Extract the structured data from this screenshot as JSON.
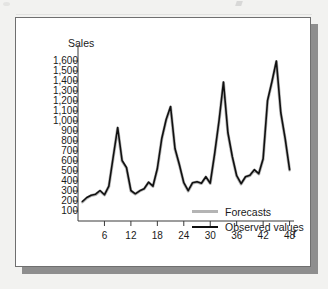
{
  "figure": {
    "background_color": "#f2f2f0",
    "card_color": "#ffffff",
    "shadow_color": "#8e8e8e"
  },
  "chart_data": {
    "type": "line",
    "title": "",
    "ylabel": "Sales",
    "xlabel": "t",
    "ylim": [
      0,
      1700
    ],
    "xlim": [
      0,
      49
    ],
    "grid": false,
    "legend_position": "inside-lower-right",
    "y_ticks": [
      100,
      200,
      300,
      400,
      500,
      600,
      700,
      800,
      900,
      1000,
      1100,
      1200,
      1300,
      1400,
      1500,
      1600
    ],
    "y_tick_labels": [
      "100",
      "200",
      "300",
      "400",
      "500",
      "600",
      "700",
      "800",
      "900",
      "1,000",
      "1,100",
      "1,200",
      "1,300",
      "1,400",
      "1,500",
      "1,600"
    ],
    "x_ticks": [
      6,
      12,
      18,
      24,
      30,
      36,
      42,
      48
    ],
    "x_tick_labels": [
      "6",
      "12",
      "18",
      "24",
      "30",
      "36",
      "42",
      "48"
    ],
    "x": [
      1,
      2,
      3,
      4,
      5,
      6,
      7,
      8,
      9,
      10,
      11,
      12,
      13,
      14,
      15,
      16,
      17,
      18,
      19,
      20,
      21,
      22,
      23,
      24,
      25,
      26,
      27,
      28,
      29,
      30,
      31,
      32,
      33,
      34,
      35,
      36,
      37,
      38,
      39,
      40,
      41,
      42,
      43,
      44,
      45,
      46,
      47,
      48
    ],
    "series": [
      {
        "name": "Forecasts",
        "color": "#b4b4b4",
        "width": 3,
        "values": [
          190,
          230,
          255,
          265,
          300,
          260,
          345,
          640,
          930,
          600,
          530,
          300,
          270,
          300,
          320,
          385,
          345,
          520,
          820,
          1010,
          1140,
          720,
          560,
          380,
          300,
          380,
          390,
          375,
          440,
          375,
          670,
          1000,
          1385,
          880,
          640,
          450,
          370,
          440,
          455,
          510,
          470,
          620,
          1200,
          1390,
          1595,
          1080,
          820,
          510
        ]
      },
      {
        "name": "Observed values",
        "color": "#101010",
        "width": 1.6,
        "values": [
          195,
          235,
          258,
          268,
          305,
          262,
          348,
          645,
          935,
          605,
          535,
          305,
          272,
          302,
          322,
          388,
          348,
          525,
          825,
          1015,
          1145,
          725,
          563,
          383,
          303,
          383,
          393,
          378,
          443,
          378,
          673,
          1005,
          1390,
          885,
          645,
          453,
          373,
          443,
          458,
          513,
          473,
          623,
          1205,
          1395,
          1600,
          1085,
          823,
          513
        ]
      }
    ]
  },
  "legend": {
    "items": [
      {
        "label": "Forecasts",
        "color": "#b4b4b4"
      },
      {
        "label": "Observed values",
        "color": "#101010"
      }
    ]
  }
}
